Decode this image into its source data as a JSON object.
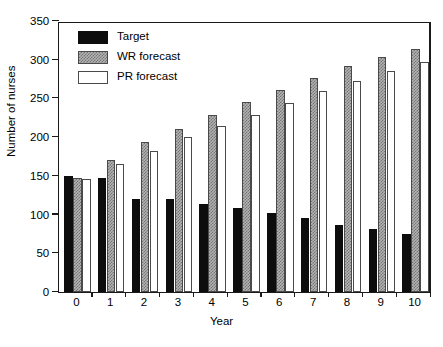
{
  "chart_data": {
    "type": "bar",
    "title": "",
    "xlabel": "Year",
    "ylabel": "Number of nurses",
    "categories": [
      "0",
      "1",
      "2",
      "3",
      "4",
      "5",
      "6",
      "7",
      "8",
      "9",
      "10"
    ],
    "ylim": [
      0,
      350
    ],
    "yticks": [
      0,
      50,
      100,
      150,
      200,
      250,
      300,
      350
    ],
    "ytick_labels": [
      "0",
      "50",
      "100",
      "150",
      "200",
      "250",
      "300",
      "350"
    ],
    "grid": false,
    "legend_position": "upper left",
    "series": [
      {
        "name": "Target",
        "fill": "black",
        "values": [
          150,
          147,
          120,
          120,
          114,
          108,
          102,
          95,
          87,
          82,
          75
        ]
      },
      {
        "name": "WR forecast",
        "fill": "gray-hatch",
        "values": [
          147,
          170,
          194,
          211,
          229,
          246,
          261,
          277,
          292,
          303,
          314
        ]
      },
      {
        "name": "PR forecast",
        "fill": "white",
        "values": [
          146,
          165,
          182,
          200,
          214,
          228,
          244,
          259,
          272,
          286,
          297
        ]
      }
    ]
  },
  "legend": {
    "items": [
      {
        "label": "Target",
        "swatch": "black-swatch"
      },
      {
        "label": "WR forecast",
        "swatch": "gray-hatch-swatch"
      },
      {
        "label": "PR forecast",
        "swatch": "white-swatch"
      }
    ]
  },
  "colors": {
    "axis": "#1a1a1a",
    "target": "#0d0d0d",
    "wr_fill": "#b4b4b4",
    "wr_hatch": "#747474",
    "pr_fill": "#ffffff",
    "bar_outline": "#4a4a4a",
    "background": "#ffffff"
  }
}
